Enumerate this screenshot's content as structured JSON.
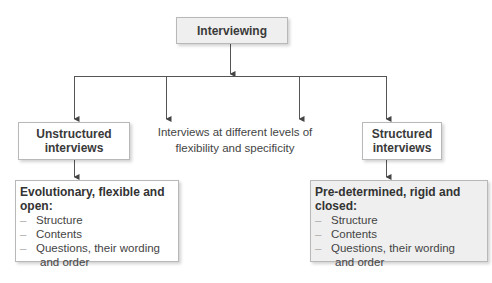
{
  "diagram": {
    "root": {
      "label": "Interviewing"
    },
    "left": {
      "label": "Unstructured interviews",
      "label_line1": "Unstructured",
      "label_line2": "interviews",
      "details": {
        "heading": "Evolutionary,  flexible and open:",
        "items": [
          "Structure",
          "Contents",
          "Questions, their wording"
        ],
        "continuation": "and order"
      }
    },
    "middle": {
      "line1": "Interviews at different levels of",
      "line2": "flexibility and specificity"
    },
    "right": {
      "label": "Structured interviews",
      "label_line1": "Structured",
      "label_line2": "interviews",
      "details": {
        "heading": "Pre-determined, rigid and closed:",
        "items": [
          "Structure",
          "Contents",
          "Questions, their wording"
        ],
        "continuation": "and order"
      }
    },
    "colors": {
      "box_fill_gray": "#efefef",
      "box_fill_white": "#ffffff",
      "border": "#b8b8b8",
      "connector": "#555555",
      "dash": "#aaaaaa"
    },
    "dash_glyph": "–"
  }
}
